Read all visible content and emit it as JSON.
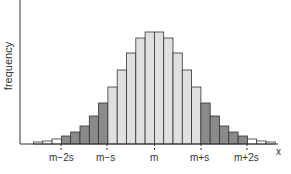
{
  "chart_data": {
    "type": "bar",
    "title": "",
    "xlabel": "x",
    "ylabel": "frequency",
    "grid": false,
    "x_tick_labels": [
      "m−2s",
      "m−s",
      "m",
      "m+s",
      "m+2s"
    ],
    "bin_width_px": 9.3,
    "values": [
      2,
      3,
      5,
      8,
      12,
      18,
      28,
      41,
      57,
      74,
      91,
      106,
      112,
      112,
      106,
      91,
      74,
      57,
      41,
      28,
      18,
      12,
      8,
      5,
      3,
      2
    ],
    "shading": [
      "white",
      "white",
      "white",
      "dark",
      "dark",
      "dark",
      "dark",
      "dark",
      "light",
      "light",
      "light",
      "light",
      "light",
      "light",
      "light",
      "light",
      "light",
      "light",
      "dark",
      "dark",
      "dark",
      "dark",
      "dark",
      "white",
      "white",
      "white"
    ],
    "colors": {
      "white": "#ffffff",
      "light": "#e0e0e0",
      "dark": "#8a8a8a",
      "stroke": "#333333"
    }
  }
}
